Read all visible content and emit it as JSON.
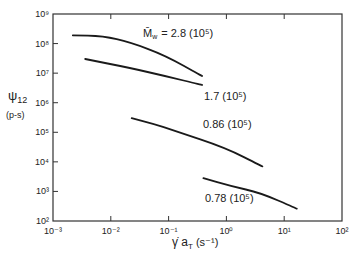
{
  "chart_data": {
    "type": "line",
    "title": "",
    "xlabel": "γ̇ a_T (s⁻¹)",
    "ylabel": "ψ12 (p-s)",
    "xscale": "log",
    "yscale": "log",
    "xlim": [
      0.001,
      100
    ],
    "ylim": [
      100,
      1000000000
    ],
    "grid": false,
    "x_ticks": [
      "10⁻³",
      "10⁻²",
      "10⁻¹",
      "10⁰",
      "10¹",
      "10²"
    ],
    "y_ticks": [
      "10²",
      "10³",
      "10⁴",
      "10⁵",
      "10⁶",
      "10⁷",
      "10⁸",
      "10⁹"
    ],
    "legend_title": "M̄w =",
    "series": [
      {
        "name": "2.8 (10⁵)",
        "label": "M̄w = 2.8 (10⁵)",
        "x": [
          0.0022,
          0.0074,
          0.0216,
          0.087,
          0.38
        ],
        "y": [
          190000000,
          180000000,
          110000000,
          40000000,
          8000000
        ]
      },
      {
        "name": "1.7 (10⁵)",
        "label": "1.7 (10⁵)",
        "x": [
          0.0036,
          0.0216,
          0.087,
          0.38
        ],
        "y": [
          30000000,
          15000000,
          8000000,
          4000000
        ]
      },
      {
        "name": "0.86 (10⁵)",
        "label": "0.86 (10⁵)",
        "x": [
          0.023,
          0.052,
          0.13,
          0.96,
          4.2
        ],
        "y": [
          300000,
          200000,
          110000,
          30000,
          7000
        ]
      },
      {
        "name": "0.78 (10⁵)",
        "label": "0.78 (10⁵)",
        "x": [
          0.4,
          1.2,
          3.9,
          16.5
        ],
        "y": [
          2800,
          1500,
          900,
          260
        ]
      }
    ]
  },
  "labels": {
    "ylabel_main": "ψ",
    "ylabel_sub": "12",
    "ylabel_units": "(p-s)",
    "xlabel_main": "γ̇ a",
    "xlabel_sub": "T",
    "xlabel_units": "(s⁻¹)",
    "mw_symbol": "M̄",
    "mw_sub": "w",
    "mw_value": "= 2.8 (10⁵)",
    "s2": "1.7 (10⁵)",
    "s3": "0.86 (10⁵)",
    "s4": "0.78 (10⁵)"
  }
}
